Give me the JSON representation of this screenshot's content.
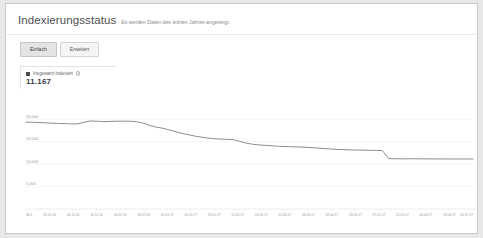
{
  "header": {
    "title": "Indexierungsstatus",
    "subtitle": "Es werden Daten des letzten Jahres angezeigt."
  },
  "tabs": [
    {
      "label": "Einfach",
      "active": true
    },
    {
      "label": "Erweitert",
      "active": false
    }
  ],
  "legend": {
    "label": "Insgesamt indexiert",
    "info_icon": "info-icon",
    "value": "11.167",
    "swatch_color": "#4d4d4d"
  },
  "chart_data": {
    "type": "line",
    "title": "Indexierungsstatus",
    "xlabel": "",
    "ylabel": "",
    "ylim": [
      0,
      25000
    ],
    "grid": true,
    "legend_position": "top-left",
    "line_color": "#808080",
    "y_ticks": [
      "20.000",
      "15.000",
      "10.000",
      "5.000"
    ],
    "y_tick_values": [
      20000,
      15000,
      10000,
      5000
    ],
    "x_ticks": [
      "08.1.",
      "23.10.16",
      "06.11.16",
      "20.11.16",
      "04.12.16",
      "18.12.16",
      "01.01.17",
      "15.01.17",
      "29.01.17",
      "12.02.17",
      "26.02.17",
      "12.03.17",
      "26.03.17",
      "09.04.17",
      "23.04.17",
      "07.05.17",
      "21.05.17",
      "04.06.17",
      "18.06.17",
      "02.07.17"
    ],
    "series": [
      {
        "name": "Insgesamt indexiert",
        "values": [
          19400,
          19350,
          19300,
          19250,
          19150,
          19100,
          19050,
          19000,
          19000,
          19400,
          19650,
          19600,
          19500,
          19550,
          19600,
          19600,
          19600,
          19500,
          19200,
          18700,
          18300,
          18050,
          17700,
          17300,
          16900,
          16600,
          16300,
          16050,
          15850,
          15700,
          15600,
          15550,
          15500,
          15100,
          14700,
          14450,
          14300,
          14200,
          14100,
          14000,
          13950,
          13900,
          13850,
          13800,
          13700,
          13600,
          13500,
          13400,
          13300,
          13250,
          13200,
          13150,
          13150,
          13100,
          13080,
          13050,
          11250,
          11220,
          11200,
          11200,
          11210,
          11200,
          11190,
          11180,
          11175,
          11170,
          11168,
          11167,
          11167,
          11167
        ]
      }
    ]
  }
}
